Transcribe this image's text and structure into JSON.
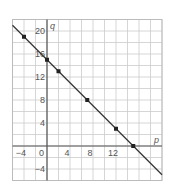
{
  "chart_data": {
    "type": "line",
    "title": "",
    "xlabel": "p",
    "ylabel": "q",
    "xlim": [
      -6,
      20
    ],
    "ylim": [
      -6,
      22
    ],
    "grid": true,
    "x_ticks": [
      -4,
      0,
      4,
      8,
      12
    ],
    "y_ticks": [
      -4,
      4,
      8,
      12,
      16,
      20
    ],
    "x_tick_labels": [
      "−4",
      "0",
      "4",
      "8",
      "12"
    ],
    "y_tick_labels": [
      "−4",
      "4",
      "8",
      "12",
      "16",
      "20"
    ],
    "series": [
      {
        "name": "q = 15 − p",
        "line": {
          "slope": -1,
          "intercept": 15,
          "x_range": [
            -6,
            20
          ]
        },
        "points": [
          {
            "x": -4,
            "y": 19
          },
          {
            "x": 0,
            "y": 15
          },
          {
            "x": 2,
            "y": 13
          },
          {
            "x": 7,
            "y": 8
          },
          {
            "x": 12,
            "y": 3
          },
          {
            "x": 15,
            "y": 0
          }
        ]
      }
    ],
    "colors": {
      "line": "#333333",
      "grid": "#cccccc",
      "axis": "#555555",
      "point": "#222222"
    }
  }
}
